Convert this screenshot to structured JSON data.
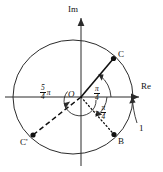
{
  "figure": {
    "axes": {
      "imaginary_label": "Im",
      "real_label": "Re",
      "origin_label": "O"
    },
    "unit_marker": {
      "label": "1",
      "description": "arrow pointing to intersection of circle with positive real axis"
    },
    "points": [
      {
        "name": "C",
        "label": "C",
        "angle_deg": 45,
        "line_style": "solid",
        "x": 113,
        "y": 58
      },
      {
        "name": "B",
        "label": "B",
        "angle_deg": -45,
        "line_style": "dotted",
        "x": 114,
        "y": 136
      },
      {
        "name": "Cp",
        "label": "C'",
        "angle_deg": 225,
        "line_style": "dashed",
        "x": 32,
        "y": 136
      }
    ],
    "angle_labels": [
      {
        "id": "pi-over-4",
        "numerator": "π",
        "denominator": "4",
        "sign": "",
        "trailing_pi": "",
        "arc": "from positive real axis to OC, counterclockwise"
      },
      {
        "id": "neg-pi-over-4",
        "numerator": "π",
        "denominator": "4",
        "sign": "−",
        "trailing_pi": "",
        "arc": "from positive real axis to OB, clockwise"
      },
      {
        "id": "five-pi-over-4",
        "numerator": "5",
        "denominator": "4",
        "sign": "",
        "trailing_pi": "π",
        "arc": "from positive real axis to OC', counterclockwise"
      }
    ],
    "colors": {
      "ink": "#111111",
      "background": "#ffffff",
      "stroke": "#2a2a2a"
    }
  }
}
